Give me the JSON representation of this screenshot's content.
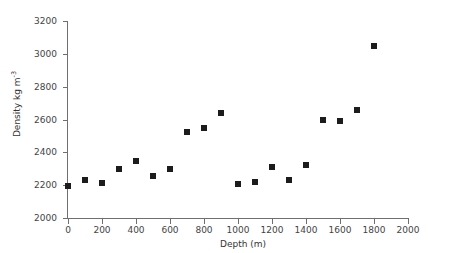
{
  "chart_data": {
    "type": "scatter",
    "title": "",
    "xlabel": "Depth (m)",
    "ylabel": "Density kg m",
    "ylabel_exponent": "-3",
    "xlim": [
      0,
      2000
    ],
    "ylim": [
      2000,
      3200
    ],
    "xticks": [
      0,
      200,
      400,
      600,
      800,
      1000,
      1200,
      1400,
      1600,
      1800,
      2000
    ],
    "yticks": [
      2000,
      2200,
      2400,
      2600,
      2800,
      3000,
      3200
    ],
    "xtick_labels": [
      "0",
      "200",
      "400",
      "600",
      "800",
      "1000",
      "1200",
      "1400",
      "1600",
      "1800",
      "2000"
    ],
    "ytick_labels": [
      "2000",
      "2200",
      "2400",
      "2600",
      "2800",
      "3000",
      "3200"
    ],
    "grid": false,
    "legend": null,
    "marker_color": "#1c1c1c",
    "marker_shape": "square",
    "axis_color": "#6f6f6f",
    "x": [
      0,
      100,
      200,
      300,
      400,
      500,
      600,
      700,
      800,
      900,
      1000,
      1100,
      1200,
      1300,
      1400,
      1500,
      1600,
      1700,
      1800
    ],
    "y": [
      2196,
      2231,
      2215,
      2299,
      2346,
      2257,
      2297,
      2523,
      2546,
      2641,
      2210,
      2221,
      2311,
      2231,
      2322,
      2596,
      2588,
      2657,
      3049
    ],
    "points": [
      {
        "depth": 0,
        "density": 2196
      },
      {
        "depth": 100,
        "density": 2231
      },
      {
        "depth": 200,
        "density": 2215
      },
      {
        "depth": 300,
        "density": 2299
      },
      {
        "depth": 400,
        "density": 2346
      },
      {
        "depth": 500,
        "density": 2257
      },
      {
        "depth": 600,
        "density": 2297
      },
      {
        "depth": 700,
        "density": 2523
      },
      {
        "depth": 800,
        "density": 2546
      },
      {
        "depth": 900,
        "density": 2641
      },
      {
        "depth": 1000,
        "density": 2210
      },
      {
        "depth": 1100,
        "density": 2221
      },
      {
        "depth": 1200,
        "density": 2311
      },
      {
        "depth": 1300,
        "density": 2231
      },
      {
        "depth": 1400,
        "density": 2322
      },
      {
        "depth": 1500,
        "density": 2596
      },
      {
        "depth": 1600,
        "density": 2588
      },
      {
        "depth": 1700,
        "density": 2657
      },
      {
        "depth": 1800,
        "density": 3049
      }
    ]
  }
}
